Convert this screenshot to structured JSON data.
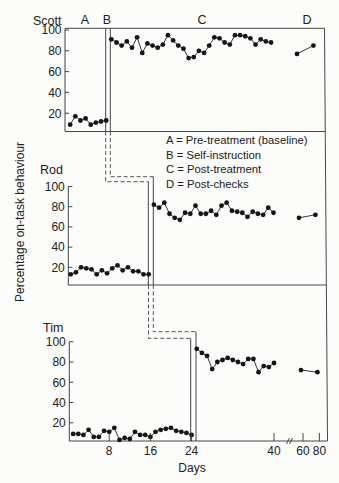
{
  "figure": {
    "y_axis_label": "Percentage on-task behaviour",
    "x_axis_label": "Days",
    "phase_header": [
      "A",
      "B",
      "C",
      "D"
    ],
    "legend": [
      {
        "code": "A",
        "text": "A = Pre-treatment (baseline)"
      },
      {
        "code": "B",
        "text": "B = Self-instruction"
      },
      {
        "code": "C",
        "text": "C = Post-treatment"
      },
      {
        "code": "D",
        "text": "D = Post-checks"
      }
    ]
  },
  "chart_data": {
    "type": "line",
    "title": "",
    "xlabel": "Days",
    "ylabel": "Percentage on-task behaviour",
    "ylim": [
      0,
      100
    ],
    "y_ticks": [
      "20",
      "40",
      "60",
      "80",
      "100"
    ],
    "x_ticks": [
      "8",
      "16",
      "24",
      "40",
      "60",
      "80"
    ],
    "x_tick_values": [
      8,
      16,
      24,
      40,
      60,
      80
    ],
    "x_axis_break": "between 40 and 60",
    "grid": false,
    "legend_placement": "right, between Scott and Rod panels",
    "phases": [
      {
        "code": "A",
        "name": "Pre-treatment (baseline)"
      },
      {
        "code": "B",
        "name": "Self-instruction"
      },
      {
        "code": "C",
        "name": "Post-treatment"
      },
      {
        "code": "D",
        "name": "Post-checks"
      }
    ],
    "panels": [
      {
        "subject": "Scott",
        "phase_change_after_day": 8,
        "series": [
          {
            "phase": "A",
            "x": [
              1,
              2,
              3,
              4,
              5,
              6,
              7,
              8
            ],
            "y": [
              9,
              17,
              13,
              15,
              9,
              11,
              12,
              13
            ]
          },
          {
            "phase": "C",
            "x": [
              9,
              10,
              11,
              12,
              13,
              14,
              15,
              16,
              17,
              18,
              19,
              20,
              21,
              22,
              23,
              24,
              25,
              26,
              27,
              28,
              29,
              30,
              31,
              32,
              33,
              34,
              35,
              36,
              37,
              38,
              39,
              40
            ],
            "y": [
              91,
              88,
              85,
              89,
              83,
              93,
              78,
              87,
              85,
              83,
              86,
              95,
              90,
              85,
              82,
              73,
              74,
              80,
              78,
              85,
              93,
              92,
              88,
              86,
              95,
              95,
              94,
              92,
              86,
              91,
              89,
              88
            ]
          },
          {
            "phase": "D",
            "x": [
              60,
              80
            ],
            "y": [
              77,
              85
            ]
          }
        ]
      },
      {
        "subject": "Rod",
        "phase_change_after_day": 16,
        "series": [
          {
            "phase": "A",
            "x": [
              1,
              2,
              3,
              4,
              5,
              6,
              7,
              8,
              9,
              10,
              11,
              12,
              13,
              14,
              15,
              16
            ],
            "y": [
              13,
              15,
              20,
              19,
              18,
              13,
              17,
              14,
              19,
              22,
              17,
              20,
              16,
              16,
              13,
              13
            ]
          },
          {
            "phase": "C",
            "x": [
              17,
              18,
              19,
              20,
              21,
              22,
              23,
              24,
              25,
              26,
              27,
              28,
              29,
              30,
              31,
              32,
              33,
              34,
              35,
              36,
              37,
              38,
              39,
              40
            ],
            "y": [
              82,
              79,
              84,
              73,
              69,
              67,
              74,
              73,
              81,
              73,
              73,
              76,
              72,
              81,
              84,
              76,
              75,
              74,
              70,
              75,
              73,
              72,
              79,
              74
            ]
          },
          {
            "phase": "D",
            "x": [
              60,
              80
            ],
            "y": [
              69,
              72
            ]
          }
        ]
      },
      {
        "subject": "Tim",
        "phase_change_after_day": 24,
        "series": [
          {
            "phase": "A",
            "x": [
              1,
              2,
              3,
              4,
              5,
              6,
              7,
              8,
              9,
              10,
              11,
              12,
              13,
              14,
              15,
              16,
              17,
              18,
              19,
              20,
              21,
              22,
              23,
              24
            ],
            "y": [
              9,
              9,
              8,
              13,
              6,
              6,
              12,
              11,
              15,
              3,
              5,
              4,
              11,
              8,
              8,
              6,
              11,
              13,
              14,
              15,
              12,
              11,
              10,
              8
            ]
          },
          {
            "phase": "C",
            "x": [
              25,
              26,
              27,
              28,
              29,
              30,
              31,
              32,
              33,
              34,
              35,
              36,
              37,
              38,
              39,
              40
            ],
            "y": [
              93,
              89,
              86,
              73,
              80,
              82,
              84,
              82,
              80,
              78,
              83,
              83,
              70,
              76,
              75,
              79
            ]
          },
          {
            "phase": "D",
            "x": [
              60,
              80
            ],
            "y": [
              72,
              70
            ]
          }
        ]
      }
    ]
  }
}
